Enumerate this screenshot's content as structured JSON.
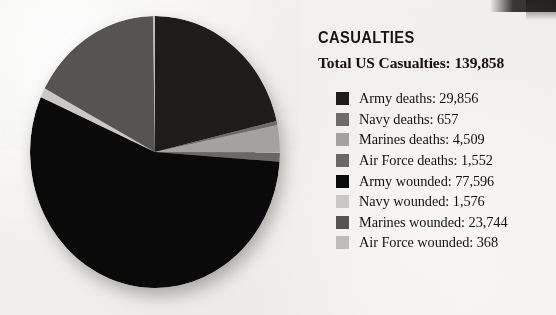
{
  "panel": {
    "heading": "CASUALTIES",
    "subheading": "Total US Casualties: 139,858"
  },
  "chart_data": {
    "type": "pie",
    "title": "CASUALTIES",
    "subtitle": "Total US Casualties: 139,858",
    "total": 139858,
    "legend_position": "right",
    "grid": false,
    "start_angle_deg": 0,
    "direction": "clockwise",
    "categories": [
      "Army deaths",
      "Navy deaths",
      "Marines deaths",
      "Air Force deaths",
      "Army wounded",
      "Navy wounded",
      "Marines wounded",
      "Air Force wounded"
    ],
    "values": [
      29856,
      657,
      4509,
      1552,
      77596,
      1576,
      23744,
      368
    ],
    "colors": [
      "#1f1d1c",
      "#6e6c6a",
      "#a3a2a0",
      "#6a6867",
      "#0b0a0a",
      "#c9c8c6",
      "#565453",
      "#bdbcba"
    ],
    "labels": [
      "Army deaths: 29,856",
      "Navy deaths: 657",
      "Marines deaths: 4,509",
      "Air Force deaths: 1,552",
      "Army wounded: 77,596",
      "Navy wounded: 1,576",
      "Marines wounded: 23,744",
      "Air Force wounded: 368"
    ]
  },
  "legend": [
    {
      "label": "Army deaths: 29,856",
      "color": "#1f1d1c"
    },
    {
      "label": "Navy deaths: 657",
      "color": "#6e6c6a"
    },
    {
      "label": "Marines deaths: 4,509",
      "color": "#a3a2a0"
    },
    {
      "label": "Air Force deaths: 1,552",
      "color": "#6a6867"
    },
    {
      "label": "Army wounded: 77,596",
      "color": "#0b0a0a"
    },
    {
      "label": "Navy wounded: 1,576",
      "color": "#c9c8c6"
    },
    {
      "label": "Marines wounded: 23,744",
      "color": "#565453"
    },
    {
      "label": "Air Force wounded: 368",
      "color": "#bdbcba"
    }
  ]
}
